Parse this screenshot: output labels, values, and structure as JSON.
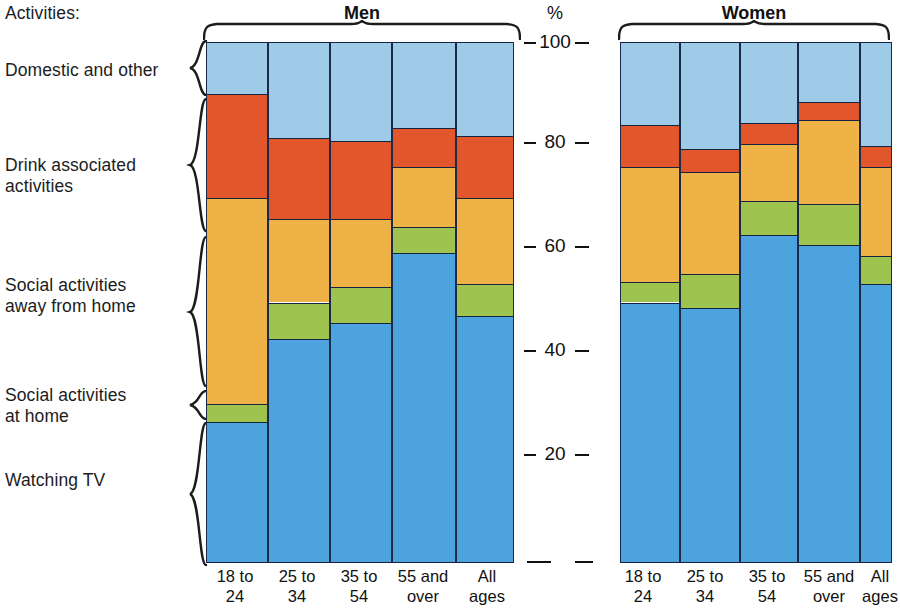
{
  "header": {
    "activities_label": "Activities:",
    "percent_symbol": "%"
  },
  "groups": [
    {
      "name": "Men"
    },
    {
      "name": "Women"
    }
  ],
  "category_labels": [
    "Domestic and other",
    "Drink associated\nactivities",
    "Social activities\naway from home",
    "Social activities\nat home",
    "Watching TV"
  ],
  "axis": {
    "ticks": [
      "100",
      "80",
      "60",
      "40",
      "20"
    ],
    "min": 0,
    "max": 100
  },
  "x_labels": [
    "18 to\n24",
    "25 to\n34",
    "35 to\n54",
    "55 and\nover",
    "All\nages"
  ],
  "colors": {
    "watching_tv": "#4da3dd",
    "social_at_home": "#9ec34f",
    "social_away": "#efb246",
    "drink_associated": "#e1562a",
    "domestic_other": "#9ecbe8",
    "outline": "#14233f",
    "gridline": "#123a8a"
  },
  "chart_data": {
    "type": "bar",
    "title": "Activities",
    "xlabel": "",
    "ylabel": "%",
    "ylim": [
      0,
      100
    ],
    "grid": true,
    "legend_position": "left",
    "stacked": true,
    "categories": [
      "Men 18 to 24",
      "Men 25 to 34",
      "Men 35 to 54",
      "Men 55 and over",
      "Men All ages",
      "Women 18 to 24",
      "Women 25 to 34",
      "Women 35 to 54",
      "Women 55 and over",
      "Women All ages"
    ],
    "series": [
      {
        "name": "Watching TV",
        "color": "#4da3dd",
        "values": [
          27,
          43,
          46,
          59.5,
          47.5,
          50,
          49,
          63,
          61,
          53.5
        ]
      },
      {
        "name": "Social activities at home",
        "color": "#9ec34f",
        "values": [
          3.5,
          7,
          7,
          5,
          6,
          4,
          6.5,
          6.5,
          8,
          5.5
        ]
      },
      {
        "name": "Social activities away from home",
        "color": "#efb246",
        "values": [
          39.5,
          16,
          13,
          11.5,
          16.5,
          22,
          19.5,
          11,
          16,
          17
        ]
      },
      {
        "name": "Drink associated activities",
        "color": "#e1562a",
        "values": [
          20,
          15.5,
          15,
          7.5,
          12,
          8,
          4.5,
          4,
          3.5,
          4
        ]
      },
      {
        "name": "Domestic and other",
        "color": "#9ecbe8",
        "values": [
          10,
          18.5,
          19,
          16.5,
          18,
          16,
          20.5,
          15.5,
          11.5,
          20
        ]
      }
    ],
    "cumulative_tops": {
      "Men 18 to 24": [
        27,
        30.5,
        70,
        90,
        100
      ],
      "Men 25 to 34": [
        43,
        50,
        66,
        81.5,
        100
      ],
      "Men 35 to 54": [
        46,
        53,
        66,
        81,
        100
      ],
      "Men 55 and over": [
        59.5,
        64.5,
        76,
        83.5,
        100
      ],
      "Men All ages": [
        47.5,
        53.5,
        70,
        82,
        100
      ],
      "Women 18 to 24": [
        50,
        54,
        76,
        84,
        100
      ],
      "Women 25 to 34": [
        49,
        55.5,
        75,
        79.5,
        100
      ],
      "Women 35 to 54": [
        63,
        69.5,
        80.5,
        84.5,
        100
      ],
      "Women 55 and over": [
        61,
        69,
        85,
        88.5,
        100
      ],
      "Women All ages": [
        53.5,
        59,
        76,
        80,
        100
      ]
    }
  }
}
